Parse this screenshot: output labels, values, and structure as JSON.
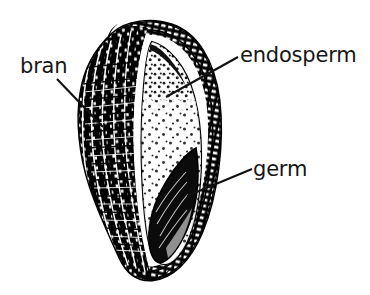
{
  "figure": {
    "background_color": "#ffffff",
    "ink_color": "#111111"
  },
  "labels": {
    "bran": {
      "text": "bran",
      "text_x": 20,
      "text_y": 73,
      "anchor": "start",
      "leader": {
        "x1": 57,
        "y1": 79,
        "x2": 103,
        "y2": 127
      }
    },
    "endosperm": {
      "text": "endosperm",
      "text_x": 240,
      "text_y": 62,
      "anchor": "start",
      "leader": {
        "x1": 238,
        "y1": 57,
        "x2": 166,
        "y2": 97
      }
    },
    "germ": {
      "text": "germ",
      "text_x": 253,
      "text_y": 176,
      "anchor": "start",
      "leader": {
        "x1": 252,
        "y1": 169,
        "x2": 187,
        "y2": 196
      }
    }
  },
  "kernel": {
    "parts": [
      {
        "name": "bran",
        "description": "outer striated husk layer on the left side of the kernel"
      },
      {
        "name": "endosperm",
        "description": "large stippled pale interior region"
      },
      {
        "name": "germ",
        "description": "solid dark wedge at the lower interior"
      }
    ],
    "bounds": {
      "left": 78,
      "top": 22,
      "right": 222,
      "bottom": 281
    }
  }
}
